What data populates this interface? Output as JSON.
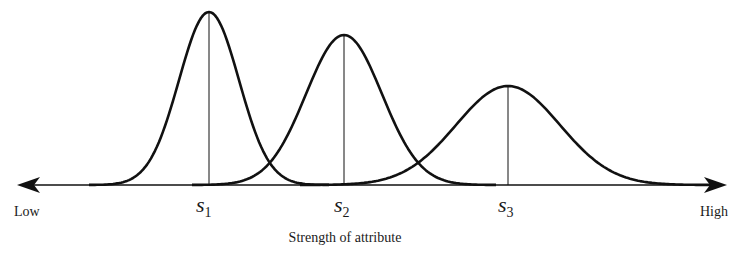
{
  "diagram": {
    "axis": {
      "low_label": "Low",
      "high_label": "High",
      "title": "Strength of attribute"
    },
    "stimuli": [
      {
        "name": "s",
        "subscript": "1",
        "peak_x": 209,
        "peak_y": 12,
        "sigma": 30
      },
      {
        "name": "s",
        "subscript": "2",
        "peak_x": 344,
        "peak_y": 35,
        "sigma": 38
      },
      {
        "name": "s",
        "subscript": "3",
        "peak_x": 508,
        "peak_y": 86,
        "sigma": 52
      }
    ],
    "colors": {
      "stroke": "#111111",
      "background": "#ffffff"
    }
  }
}
